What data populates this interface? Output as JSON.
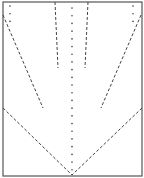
{
  "diagram": {
    "type": "paper-folding-pattern",
    "colors": {
      "background": "#ffffff",
      "line": "#444444",
      "border": "#555555"
    },
    "border": {
      "x": 3,
      "y": 2,
      "width": 139,
      "height": 174
    },
    "dotted_lines": [
      {
        "name": "center-vertical-dotted-line",
        "x1": 72,
        "y1": 8,
        "x2": 72,
        "y2": 170
      },
      {
        "name": "top-left-dotted-marks",
        "x1": 10,
        "y1": 6,
        "x2": 10,
        "y2": 23
      },
      {
        "name": "top-right-dotted-marks",
        "x1": 133,
        "y1": 6,
        "x2": 133,
        "y2": 23
      }
    ],
    "dashed_lines": [
      {
        "name": "inner-left-dashed-line",
        "x1": 55,
        "y1": 2,
        "x2": 58,
        "y2": 68
      },
      {
        "name": "inner-right-dashed-line",
        "x1": 88,
        "y1": 2,
        "x2": 85,
        "y2": 68
      },
      {
        "name": "outer-left-dashed-diagonal",
        "x1": 3,
        "y1": 15,
        "x2": 43,
        "y2": 108
      },
      {
        "name": "outer-right-dashed-diagonal",
        "x1": 141,
        "y1": 15,
        "x2": 101,
        "y2": 108
      },
      {
        "name": "bottom-left-dashed-diagonal",
        "x1": 3,
        "y1": 108,
        "x2": 72,
        "y2": 175
      },
      {
        "name": "bottom-right-dashed-diagonal",
        "x1": 142,
        "y1": 108,
        "x2": 72,
        "y2": 175
      }
    ]
  }
}
